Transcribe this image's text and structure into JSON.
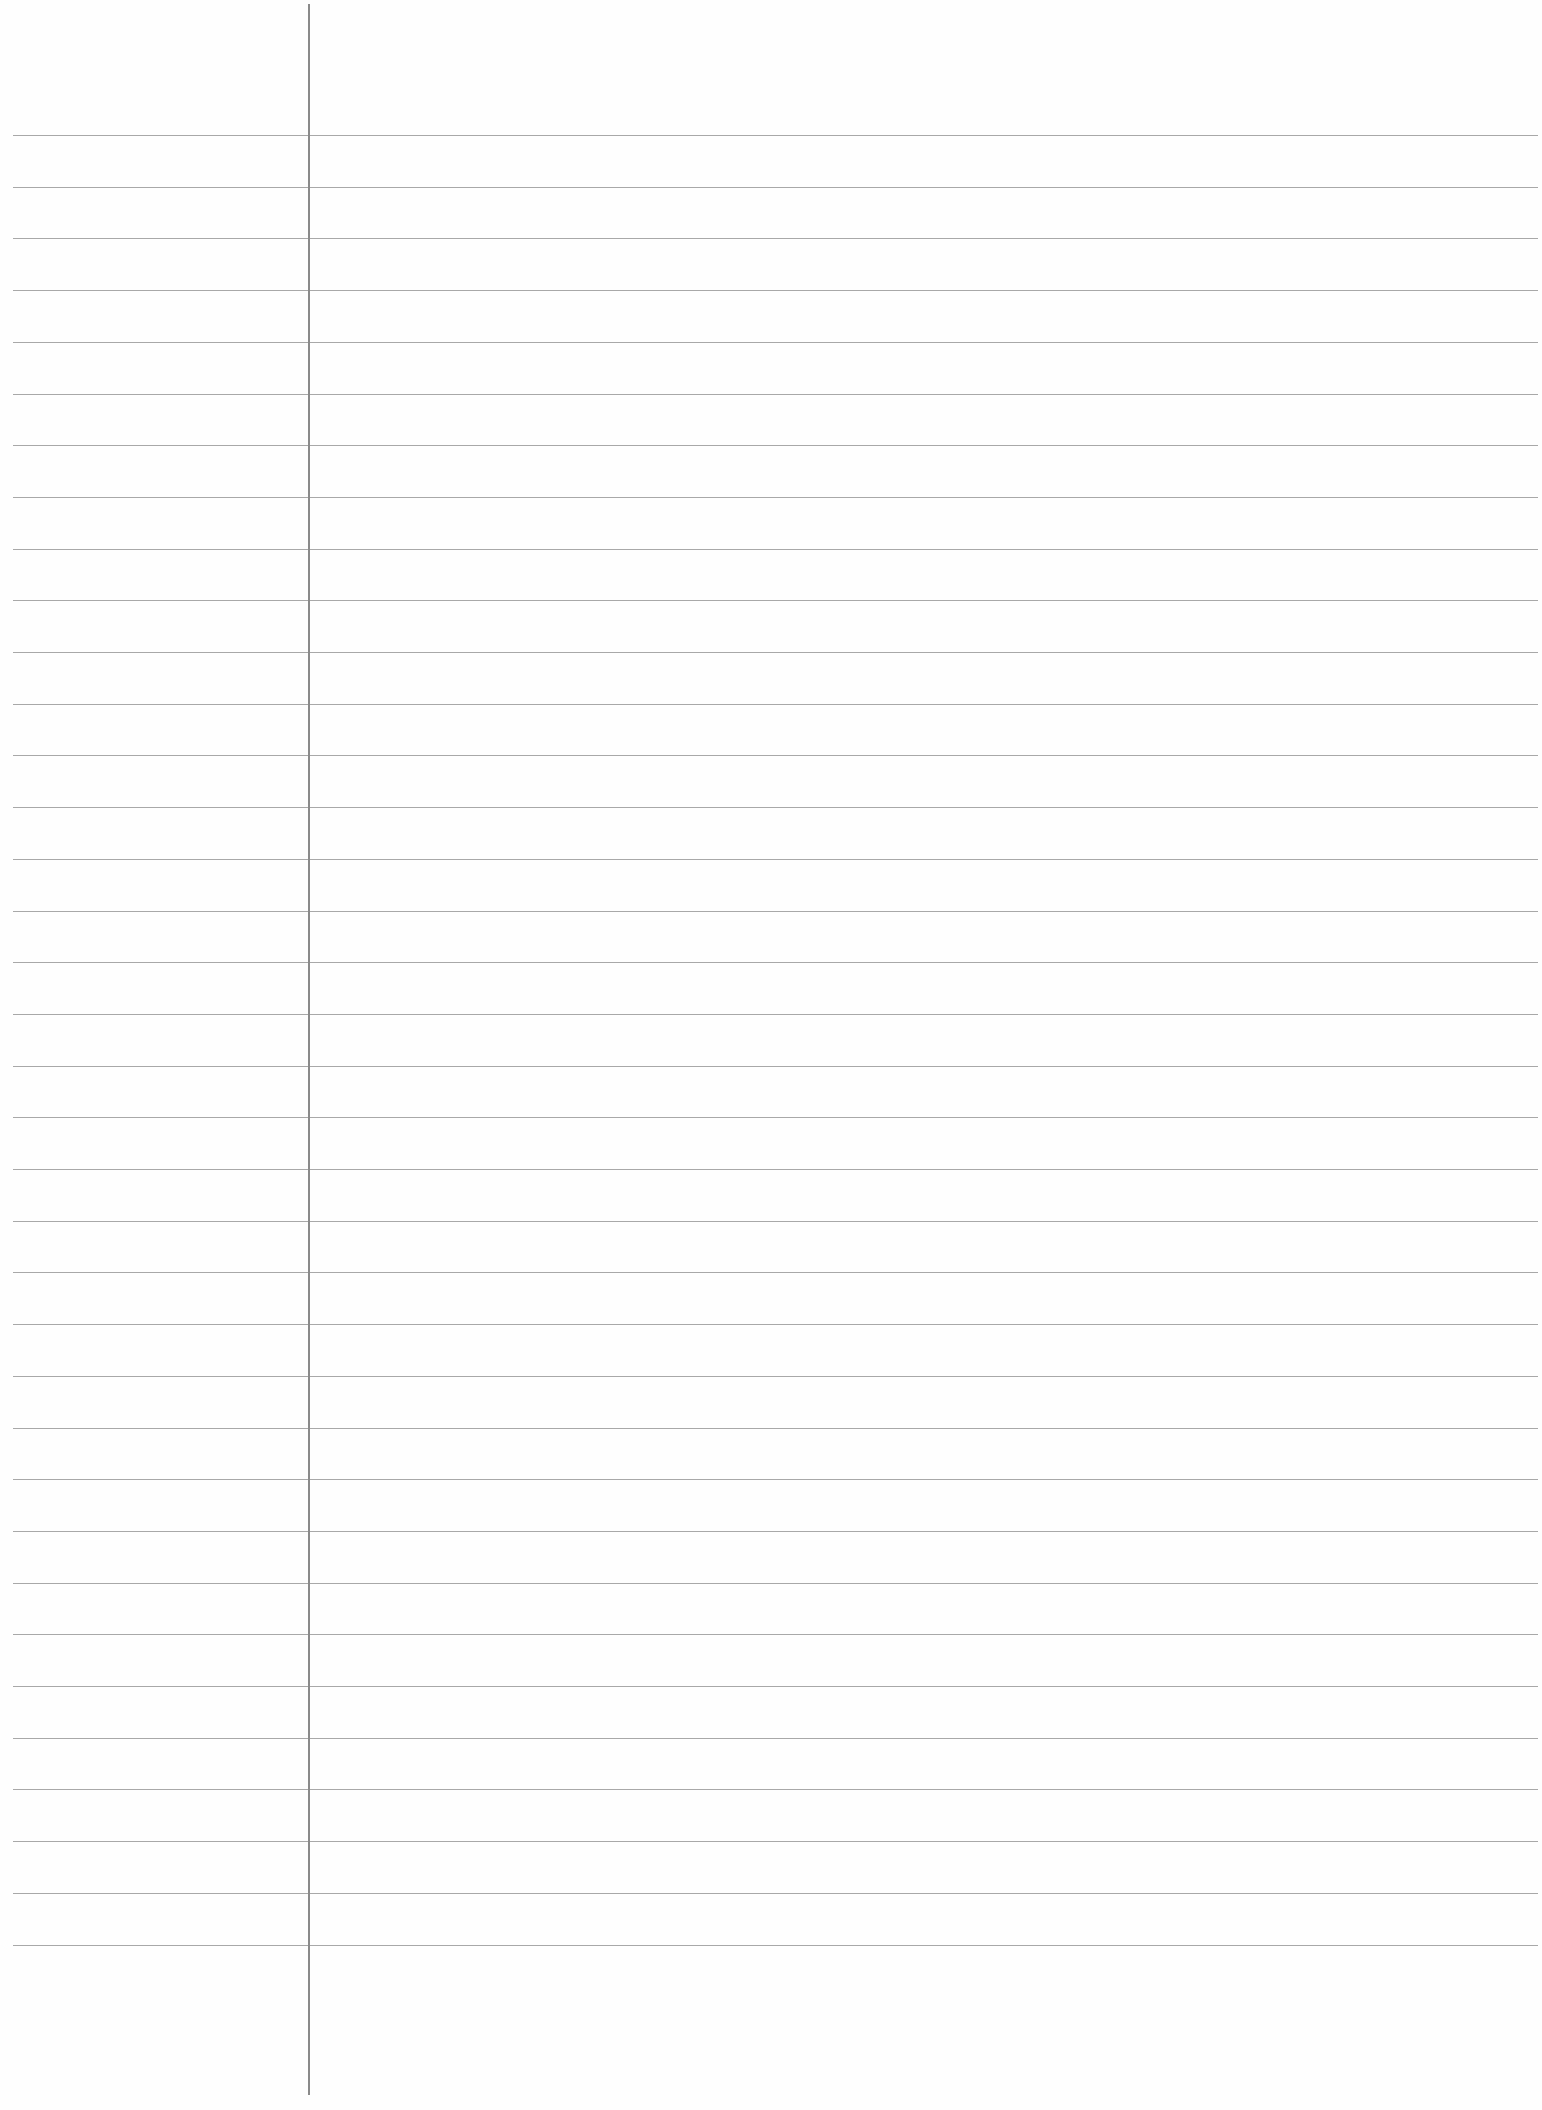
{
  "page": {
    "type": "lined-notebook-paper",
    "width": 1542,
    "height": 2110,
    "background_color": "#fefefe",
    "rule_color": "#a8a8a8",
    "margin_line_color": "#8a8a8a",
    "rules": {
      "count": 36,
      "first_y": 135,
      "spacing": 51.7,
      "left_x": 13,
      "right_x": 1538
    },
    "margin_line": {
      "x": 308,
      "top_y": 4,
      "bottom_y": 2095
    }
  }
}
